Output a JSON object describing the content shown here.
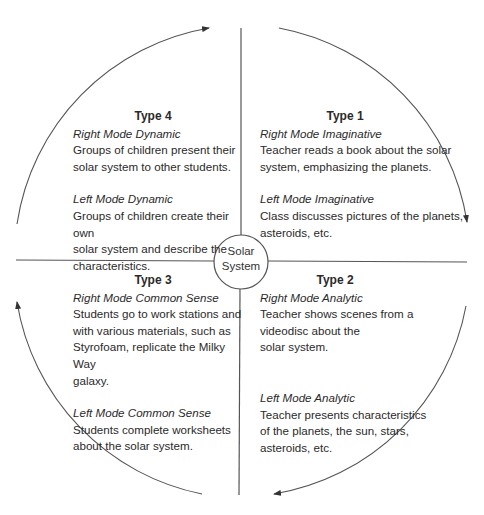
{
  "diagram": {
    "type": "4MAT learning cycle",
    "center": {
      "label": "Solar\nSystem"
    },
    "colors": {
      "stroke": "#555555",
      "text": "#2a2a2a",
      "background": "#ffffff"
    },
    "quadrants": [
      {
        "position": "top-right",
        "title": "Type 1",
        "right_mode": {
          "label": "Right Mode Imaginative",
          "text": "Teacher reads a book about the solar\nsystem, emphasizing the planets."
        },
        "left_mode": {
          "label": "Left Mode Imaginative",
          "text": "Class discusses pictures of the planets,\nasteroids, etc."
        }
      },
      {
        "position": "bottom-right",
        "title": "Type 2",
        "right_mode": {
          "label": "Right Mode Analytic",
          "text": "Teacher shows scenes from a\nvideodisc about the\nsolar system."
        },
        "left_mode": {
          "label": "Left Mode Analytic",
          "text": "Teacher presents characteristics\nof the planets, the sun, stars,\nasteroids, etc."
        }
      },
      {
        "position": "bottom-left",
        "title": "Type 3",
        "right_mode": {
          "label": "Right Mode Common Sense",
          "text": "Students go to work stations and\nwith various materials, such as\nStyrofoam, replicate the Milky Way\ngalaxy."
        },
        "left_mode": {
          "label": "Left Mode Common Sense",
          "text": "Students complete worksheets\nabout the solar system."
        }
      },
      {
        "position": "top-left",
        "title": "Type 4",
        "right_mode": {
          "label": "Right Mode Dynamic",
          "text": "Groups of children present their\nsolar system to other students."
        },
        "left_mode": {
          "label": "Left Mode Dynamic",
          "text": "Groups of children create their own\nsolar system and describe the\ncharacteristics."
        }
      }
    ],
    "flow": "clockwise arrows connecting quadrants"
  }
}
